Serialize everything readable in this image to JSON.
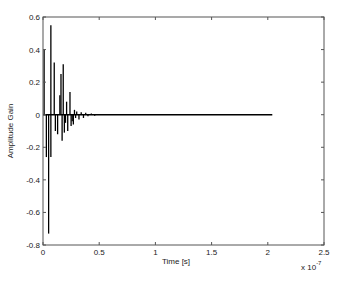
{
  "chart_data": {
    "type": "line",
    "title": "",
    "xlabel": "Time [s]",
    "ylabel": "Amplitude Gain",
    "x_multiplier_label": "x 10",
    "x_multiplier_exponent": "-7",
    "xlim": [
      0,
      2.5
    ],
    "ylim": [
      -0.8,
      0.6
    ],
    "x_ticks": [
      0,
      0.5,
      1,
      1.5,
      2,
      2.5
    ],
    "x_tick_labels": [
      "0",
      "0.5",
      "1",
      "1.5",
      "2",
      "2.5"
    ],
    "y_ticks": [
      0.6,
      0.4,
      0.2,
      0,
      -0.2,
      -0.4,
      -0.6,
      -0.8
    ],
    "y_tick_labels": [
      "0.6",
      "0.4",
      "0.2",
      "0",
      "-0.2",
      "-0.4",
      "-0.6",
      "-0.8"
    ],
    "grid": false,
    "legend": null,
    "x_unit_scale": 1e-07,
    "signal_end_x": 2.04,
    "series": [
      {
        "name": "impulse response",
        "color": "#000000",
        "x": [
          0.01,
          0.03,
          0.05,
          0.07,
          0.07,
          0.1,
          0.11,
          0.13,
          0.15,
          0.16,
          0.17,
          0.18,
          0.19,
          0.2,
          0.21,
          0.22,
          0.24,
          0.25,
          0.26,
          0.27,
          0.28,
          0.29,
          0.3,
          0.32,
          0.34,
          0.36,
          0.38,
          0.4,
          0.43,
          0.46,
          0.5,
          0.55
        ],
        "values": [
          0.4,
          -0.26,
          -0.73,
          0.55,
          -0.26,
          0.32,
          -0.1,
          -0.12,
          0.12,
          0.25,
          -0.16,
          0.31,
          -0.11,
          -0.05,
          0.08,
          -0.1,
          0.14,
          -0.07,
          -0.04,
          -0.06,
          0.03,
          -0.02,
          0.02,
          -0.03,
          0.015,
          -0.02,
          0.012,
          -0.01,
          0.008,
          -0.006,
          0.004,
          0.002
        ]
      }
    ]
  },
  "colors": {
    "axis": "#555555",
    "signal": "#000000",
    "background": "#ffffff"
  }
}
